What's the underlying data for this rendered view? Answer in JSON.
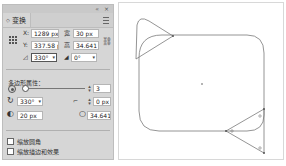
{
  "panel": {
    "top_controls": {
      "collapse": "«",
      "close": "×"
    },
    "tab": {
      "arrow": "◇",
      "label": "变换"
    },
    "menu_icon": "panel-menu-icon",
    "transform": {
      "x_label": "X:",
      "x_value": "1289 px",
      "y_label": "Y:",
      "y_value": "337.58 px",
      "width_label": "宽",
      "width_value": "30 px",
      "height_label": "高",
      "height_value": "34.641 px",
      "rotate_value": "330°",
      "shear_value": "0°",
      "link_icon": "constrain-proportions-icon"
    },
    "polygon": {
      "section_title": "多边形属性：",
      "sides_value": "3",
      "rotation_value": "330°",
      "corner_type_value": "0 px",
      "radius_value": "20 px",
      "side_length_value": "34.641 px"
    },
    "checkboxes": [
      {
        "label": "缩放圆角",
        "checked": false
      },
      {
        "label": "缩放描边和效果",
        "checked": false
      }
    ]
  },
  "canvas": {
    "stroke_color": "#7a7a7a",
    "background": "#ffffff"
  }
}
